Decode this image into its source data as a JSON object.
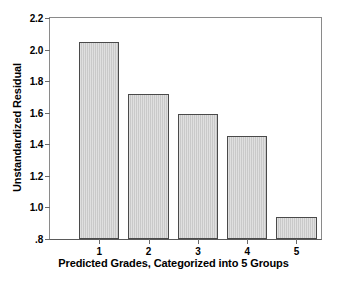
{
  "chart_data": {
    "type": "bar",
    "title": "",
    "xlabel": "Predicted Grades, Categorized into 5 Groups",
    "ylabel": "Unstandardized Residual",
    "categories": [
      "1",
      "2",
      "3",
      "4",
      "5"
    ],
    "values": [
      2.05,
      1.72,
      1.59,
      1.455,
      0.94
    ],
    "ylim": [
      0.8,
      2.2
    ],
    "ytick_labels": [
      "2.2",
      "2.0",
      "1.8",
      "1.6",
      "1.4",
      "1.2",
      "1.0",
      ".8"
    ],
    "ytick_values": [
      2.2,
      2.0,
      1.8,
      1.6,
      1.4,
      1.2,
      1.0,
      0.8
    ],
    "xtick_labels": [
      "1",
      "2",
      "3",
      "4",
      "5"
    ],
    "grid": false,
    "legend": false,
    "bar_fill_color": "#c9c9c9",
    "bar_edge_color": "#4a4a4a",
    "axis_color": "#8a8a8a",
    "background_color": "#ffffff"
  }
}
